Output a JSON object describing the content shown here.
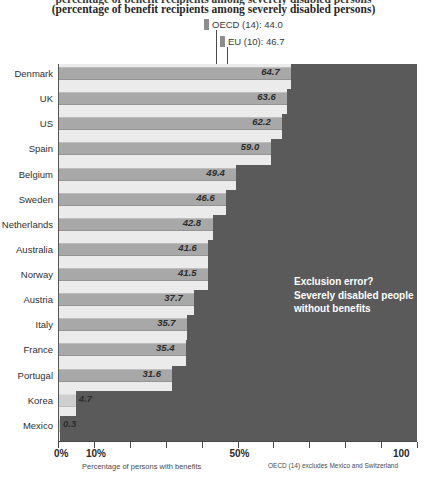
{
  "chart_data": {
    "type": "bar",
    "orientation": "horizontal",
    "title": "(percentage of benefit recipients among severely disabled persons)",
    "title_clipped": "percentage of benefit recipients among severely disabled persons",
    "xlabel": "Percentage of persons with benefits",
    "ylabel": "",
    "xlim": [
      0,
      100
    ],
    "categories": [
      "Denmark",
      "UK",
      "US",
      "Spain",
      "Belgium",
      "Sweden",
      "Netherlands",
      "Australia",
      "Norway",
      "Austria",
      "Italy",
      "France",
      "Portugal",
      "Korea",
      "Mexico"
    ],
    "values": [
      64.7,
      63.6,
      62.2,
      59.0,
      49.4,
      46.6,
      42.8,
      41.6,
      41.5,
      37.7,
      35.7,
      35.4,
      31.6,
      4.7,
      0.3
    ],
    "value_labels": [
      "64.7",
      "63.6",
      "62.2",
      "59.0",
      "49.4",
      "46.6",
      "42.8",
      "41.6",
      "41.5",
      "37.7",
      "35.7",
      "35.4",
      "31.6",
      "4.7",
      "0.3"
    ],
    "tick_values": [
      0,
      10,
      20,
      30,
      40,
      50,
      60,
      70,
      80,
      90,
      100
    ],
    "tick_labels": [
      {
        "value": 0,
        "label": "0%"
      },
      {
        "value": 10,
        "label": "10%"
      },
      {
        "value": 50,
        "label": "50%"
      },
      {
        "value": 100,
        "label": "100"
      }
    ],
    "reference_lines": [
      {
        "name": "OECD",
        "label": "OECD (14): 44.0",
        "value": 44.0
      },
      {
        "name": "EU",
        "label": "EU (10): 46.7",
        "value": 46.7
      }
    ],
    "annotation": "Exclusion error?\nSeverely disabled people\nwithout benefits",
    "footnotes": [
      "Percentage of persons with benefits",
      "OECD (14) excludes Mexico and Switzerland"
    ],
    "grid": false,
    "legend": "none",
    "colors": {
      "bar": "#a8a8a8",
      "bar_light": "#cfcfcf",
      "plot_background": "#ebebeb",
      "exclusion_region": "#5a5a5a",
      "annotation_text": "#ffffff",
      "axis": "#4a4a4a"
    }
  }
}
